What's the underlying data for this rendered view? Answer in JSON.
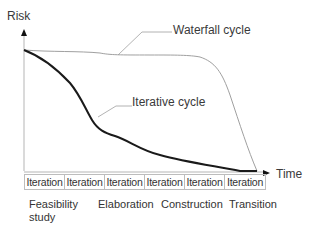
{
  "diagram": {
    "y_axis_label": "Risk",
    "x_axis_label": "Time",
    "curves": [
      {
        "name": "waterfall",
        "label": "Waterfall cycle",
        "color": "#9a9a9a",
        "style": "thin"
      },
      {
        "name": "iterative",
        "label": "Iterative cycle",
        "color": "#1a1a1a",
        "style": "thick"
      }
    ],
    "iterations": [
      {
        "label": "Iteration"
      },
      {
        "label": "Iteration"
      },
      {
        "label": "Iteration"
      },
      {
        "label": "Iteration"
      },
      {
        "label": "Iteration"
      },
      {
        "label": "Iteration"
      }
    ],
    "phases": [
      {
        "line1": "Feasibility",
        "line2": "study"
      },
      {
        "line1": "Elaboration"
      },
      {
        "line1": "Construction"
      },
      {
        "line1": "Transition"
      }
    ]
  }
}
